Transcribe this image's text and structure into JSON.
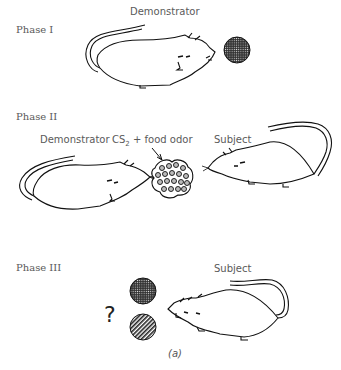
{
  "figure": {
    "caption": "(a)",
    "phases": [
      {
        "label": "Phase I",
        "roles": {
          "demonstrator": "Demonstrator"
        }
      },
      {
        "label": "Phase II",
        "roles": {
          "demonstrator": "Demonstrator",
          "odor": "CS",
          "odor_sub": "2",
          "odor_rest": " + food odor",
          "subject": "Subject"
        }
      },
      {
        "label": "Phase III",
        "roles": {
          "subject": "Subject"
        },
        "question": "?"
      }
    ],
    "icons": [
      "rat-icon",
      "food-pellet-dotted-icon",
      "food-pellet-striped-icon",
      "odor-cluster-icon",
      "arrow-icon"
    ]
  }
}
